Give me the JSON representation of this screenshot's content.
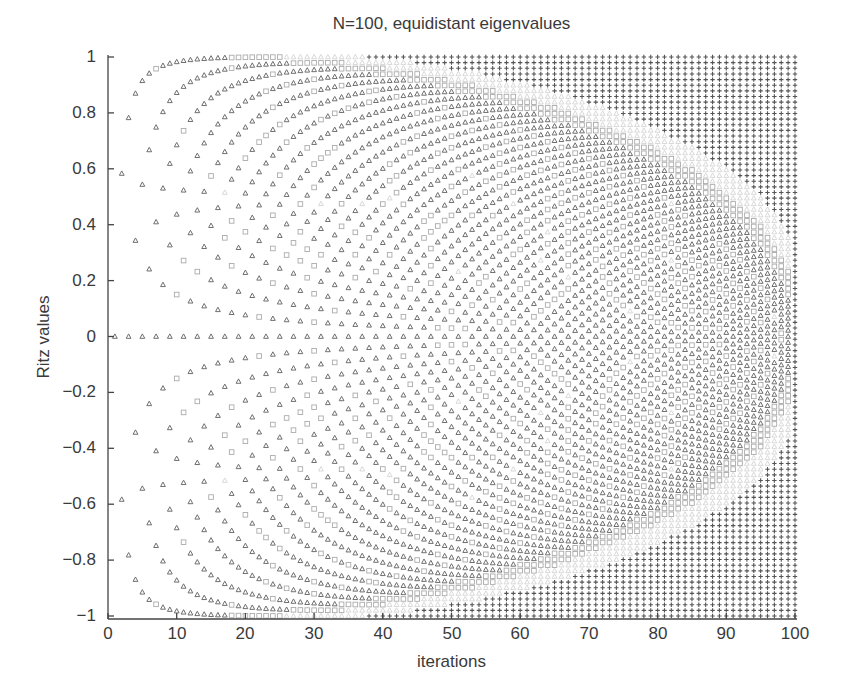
{
  "chart_data": {
    "type": "scatter",
    "title": "N=100, equidistant eigenvalues",
    "xlabel": "iterations",
    "ylabel": "Ritz values",
    "xlim": [
      0,
      100
    ],
    "ylim": [
      -1,
      1
    ],
    "grid": false,
    "legend": null,
    "x_ticks": [
      "0",
      "10",
      "20",
      "30",
      "40",
      "50",
      "60",
      "70",
      "80",
      "90",
      "100"
    ],
    "y_ticks": [
      "1",
      "0.8",
      "0.6",
      "0.4",
      "0.2",
      "0",
      "−0.2",
      "−0.4",
      "−0.6",
      "−0.8",
      "−1"
    ],
    "matrix_size_N": 100,
    "eigenvalues": {
      "distribution": "equidistant",
      "min": -1,
      "max": 1,
      "count": 100
    },
    "iterations": {
      "from": 1,
      "to": 100
    },
    "series": [
      {
        "name": "unconverged Ritz values",
        "marker": "triangle",
        "color": "#6f6f6f",
        "max_distance": null
      },
      {
        "name": "partially converged Ritz values",
        "marker": "square",
        "color": "#ababab",
        "max_distance": 0.002
      },
      {
        "name": "nearly converged Ritz values",
        "marker": "triangle",
        "color": "#d9d9d9",
        "max_distance": 0.0001
      },
      {
        "name": "converged Ritz values",
        "marker": "plus",
        "color": "#555555",
        "max_distance": 1e-07
      }
    ],
    "sample_points": [
      {
        "iteration": 1,
        "ritz_values": [
          0
        ]
      },
      {
        "iteration": 2,
        "ritz_values": [
          -0.58,
          0.58
        ]
      },
      {
        "iteration": 3,
        "ritz_values": [
          -0.78,
          0,
          0.78
        ]
      },
      {
        "iteration": 100,
        "ritz_values": "all 100 eigenvalues (converged)"
      }
    ]
  },
  "axis_color": "#444444"
}
